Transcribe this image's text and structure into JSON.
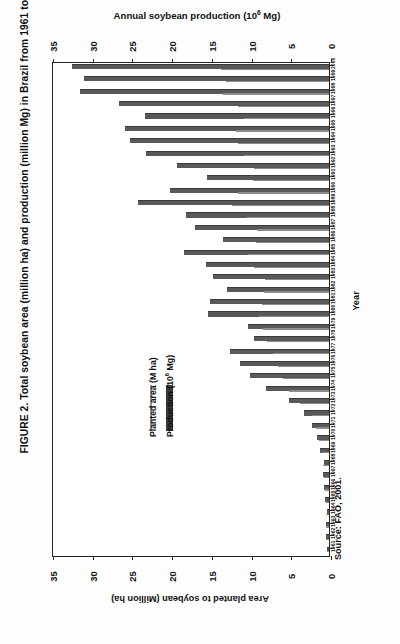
{
  "figure": {
    "caption": "FIGURE 2. Total soybean area (million ha) and production (million Mg) in Brazil from 1961 to 2000.",
    "source_note": "Source: FAO, 2001."
  },
  "legend": {
    "position": "inside-left",
    "entries": [
      {
        "label": "Planted area (M ha)",
        "color": "#8f8f8f",
        "style": "thin-line"
      },
      {
        "label": "Production (10⁶ Mg)",
        "color": "#3a3a3a",
        "style": "thick-bar"
      }
    ]
  },
  "chart_data": {
    "type": "bar",
    "orientation": "horizontal-rotated",
    "xlabel": "Annual soybean production (10⁶ Mg)",
    "xlabel_secondary": "Area planted to soybean (Million ha)",
    "ylabel": "Year",
    "xlim": [
      0,
      35
    ],
    "xticks": [
      35,
      30,
      25,
      20,
      15,
      10,
      5,
      0
    ],
    "xtick_labels": [
      "35",
      "30",
      "25",
      "20",
      "15",
      "10",
      "5",
      "0"
    ],
    "axis_direction": "reversed-left-to-right",
    "grid": false,
    "categories": [
      "2000",
      "1999",
      "1998",
      "1997",
      "1996",
      "1995",
      "1994",
      "1993",
      "1992",
      "1991",
      "1990",
      "1989",
      "1988",
      "1987",
      "1986",
      "1985",
      "1984",
      "1983",
      "1982",
      "1981",
      "1980",
      "1979",
      "1978",
      "1977",
      "1976",
      "1975",
      "1974",
      "1973",
      "1972",
      "1971",
      "1970",
      "1969",
      "1968",
      "1967",
      "1966",
      "1965",
      "1964",
      "1963",
      "1962",
      "1961"
    ],
    "series": [
      {
        "name": "Production (10⁶ Mg)",
        "color": "#595959",
        "values": [
          32.3,
          30.9,
          31.3,
          26.4,
          23.2,
          25.7,
          25.0,
          23.0,
          19.2,
          15.4,
          20.0,
          24.1,
          18.0,
          16.9,
          13.3,
          18.3,
          15.5,
          14.6,
          12.8,
          15.0,
          15.2,
          10.2,
          9.5,
          12.5,
          11.2,
          9.9,
          7.9,
          5.0,
          3.2,
          2.1,
          1.5,
          1.1,
          0.65,
          0.72,
          0.6,
          0.52,
          0.31,
          0.32,
          0.35,
          0.27
        ]
      },
      {
        "name": "Planted area (M ha)",
        "color": "#8c8c8c",
        "values": [
          13.6,
          13.0,
          13.3,
          11.5,
          10.7,
          11.7,
          11.5,
          10.7,
          9.4,
          9.6,
          11.5,
          12.2,
          10.5,
          9.1,
          9.2,
          10.2,
          9.4,
          8.1,
          8.2,
          8.5,
          8.8,
          8.3,
          7.8,
          7.1,
          6.4,
          5.8,
          5.1,
          3.6,
          2.2,
          1.7,
          1.3,
          0.91,
          0.72,
          0.61,
          0.49,
          0.43,
          0.32,
          0.34,
          0.34,
          0.24
        ]
      }
    ]
  }
}
